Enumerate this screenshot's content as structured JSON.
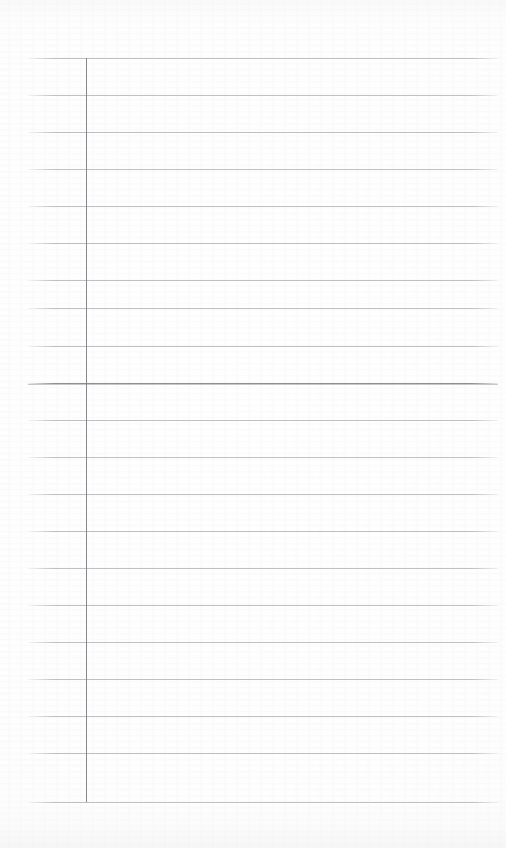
{
  "document": {
    "kind": "scanned-ruled-notebook-page",
    "title": "Blank ruled notebook page",
    "page_width": 506,
    "page_height": 848,
    "paper_color": "#fefefe",
    "text_content": "",
    "has_handwriting": false
  },
  "ruling": {
    "line_color": "#b9bbbe",
    "emphasis_line_color": "#8c8f93",
    "line_count": 21,
    "line_left": 28,
    "line_right": 498,
    "line_width": 470,
    "first_line_y": 58,
    "last_line_y": 802,
    "line_spacing": 37.2,
    "emphasis_line_index": 9,
    "line_positions": [
      58,
      95,
      132,
      169,
      206,
      243,
      280,
      308,
      346,
      383,
      420,
      457,
      494,
      531,
      568,
      605,
      642,
      679,
      716,
      753,
      802
    ]
  },
  "margin_rule": {
    "color": "#7e8185",
    "x": 86,
    "top": 58,
    "bottom": 802,
    "orientation": "vertical"
  },
  "regions": {
    "left_gutter_label": "margin gutter",
    "writing_area_label": "writing area"
  }
}
